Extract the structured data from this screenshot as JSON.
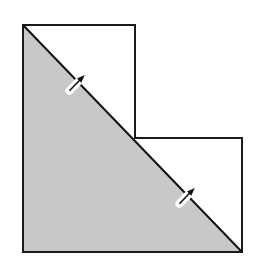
{
  "diagram": {
    "title": "",
    "shape": "L-shaped figure of two stacked squares with a diagonal fold",
    "colors": {
      "background": "#ffffff",
      "outline": "#1a1a1a",
      "shaded_region": "#c8c8c8",
      "marker": "#111111",
      "marker_halo": "#ffffff"
    },
    "outline_points": [
      [
        23,
        25
      ],
      [
        135,
        25
      ],
      [
        135,
        138
      ],
      [
        242,
        138
      ],
      [
        242,
        252
      ],
      [
        23,
        252
      ]
    ],
    "diagonal": {
      "from": [
        23,
        25
      ],
      "to": [
        242,
        252
      ]
    },
    "shaded_triangle": [
      [
        23,
        25
      ],
      [
        242,
        252
      ],
      [
        23,
        252
      ]
    ],
    "markers": [
      {
        "name": "pin-marker-upper",
        "center": [
          75,
          85
        ]
      },
      {
        "name": "pin-marker-lower",
        "center": [
          185,
          198
        ]
      }
    ]
  }
}
